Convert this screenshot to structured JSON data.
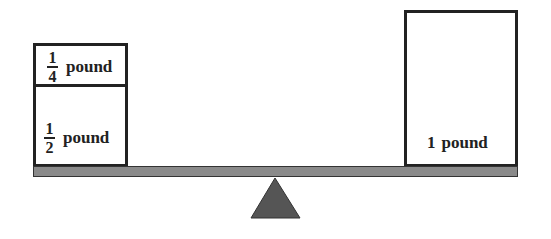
{
  "diagram": {
    "type": "balance-scale",
    "left_pan": {
      "weights": [
        {
          "numerator": "1",
          "denominator": "4",
          "unit": "pound"
        },
        {
          "numerator": "1",
          "denominator": "2",
          "unit": "pound"
        }
      ]
    },
    "right_pan": {
      "weights": [
        {
          "value": "1",
          "unit": "pound"
        }
      ]
    },
    "colors": {
      "beam": "#8a8a8a",
      "fulcrum": "#555555",
      "outline": "#222222"
    }
  }
}
